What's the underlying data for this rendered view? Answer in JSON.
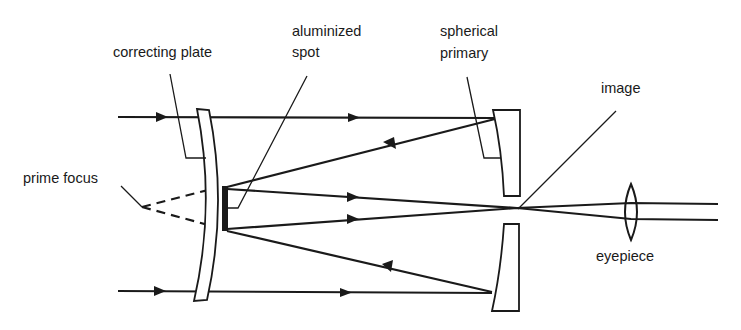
{
  "diagram": {
    "labels": {
      "correcting_plate": "correcting plate",
      "aluminized_spot_line1": "aluminized",
      "aluminized_spot_line2": "spot",
      "spherical_primary_line1": "spherical",
      "spherical_primary_line2": "primary",
      "image": "image",
      "prime_focus": "prime focus",
      "eyepiece": "eyepiece"
    },
    "colors": {
      "ink": "#1a1a1a",
      "background": "#ffffff"
    },
    "components": [
      {
        "name": "correcting plate",
        "type": "curved lens"
      },
      {
        "name": "aluminized spot",
        "type": "secondary mirror"
      },
      {
        "name": "spherical primary",
        "type": "mirror with central hole"
      },
      {
        "name": "eyepiece",
        "type": "biconvex lens"
      }
    ],
    "rays": [
      {
        "name": "upper incoming ray",
        "direction": "right"
      },
      {
        "name": "upper reflected ray to spot",
        "direction": "left"
      },
      {
        "name": "upper converging ray to image",
        "direction": "right"
      },
      {
        "name": "lower converging ray to image",
        "direction": "right"
      },
      {
        "name": "lower reflected ray to spot",
        "direction": "left"
      },
      {
        "name": "lower incoming ray",
        "direction": "right"
      }
    ]
  }
}
